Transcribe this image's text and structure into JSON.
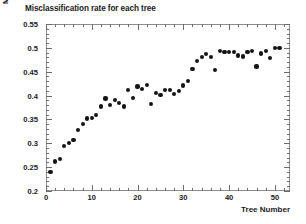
{
  "chart_data": {
    "type": "scatter",
    "title": "Misclassification rate for each tree",
    "xlabel": "Tree Number",
    "ylabel": "Misclassification rate",
    "xlim": [
      0,
      53.3
    ],
    "ylim": [
      0.2,
      0.55
    ],
    "grid": false,
    "legend": null,
    "marker": "filled-circle",
    "marker_color": "#141414",
    "xticks": [
      0,
      10,
      20,
      30,
      40,
      50
    ],
    "xtick_labels": [
      "0",
      "10",
      "20",
      "30",
      "40",
      "50"
    ],
    "xminor_step": 2,
    "yticks": [
      0.2,
      0.25,
      0.3,
      0.35,
      0.4,
      0.45,
      0.5,
      0.55
    ],
    "ytick_labels": [
      "0.2",
      "0.25",
      "0.3",
      "0.35",
      "0.4",
      "0.45",
      "0.5",
      "0.55"
    ],
    "yminor_step": 0.01,
    "x": [
      1,
      2,
      3,
      4,
      5,
      6,
      7,
      8,
      9,
      10,
      11,
      12,
      13,
      14,
      15,
      16,
      17,
      18,
      19,
      20,
      21,
      22,
      23,
      24,
      25,
      26,
      27,
      28,
      29,
      30,
      31,
      32,
      33,
      34,
      35,
      36,
      37,
      38,
      39,
      40,
      41,
      42,
      43,
      44,
      45,
      46,
      47,
      48,
      49,
      50,
      51
    ],
    "values": [
      0.24,
      0.262,
      0.267,
      0.294,
      0.3,
      0.307,
      0.327,
      0.341,
      0.352,
      0.353,
      0.36,
      0.377,
      0.394,
      0.38,
      0.39,
      0.384,
      0.377,
      0.411,
      0.395,
      0.419,
      0.413,
      0.422,
      0.382,
      0.406,
      0.402,
      0.412,
      0.412,
      0.404,
      0.41,
      0.421,
      0.43,
      0.455,
      0.472,
      0.481,
      0.487,
      0.481,
      0.454,
      0.494,
      0.491,
      0.492,
      0.492,
      0.484,
      0.482,
      0.492,
      0.493,
      0.461,
      0.488,
      0.494,
      0.479,
      0.499,
      0.5
    ]
  },
  "axes": {
    "title": "Misclassification rate for each tree",
    "x_title": "Tree Number",
    "y_title": "Misclassification rate"
  }
}
